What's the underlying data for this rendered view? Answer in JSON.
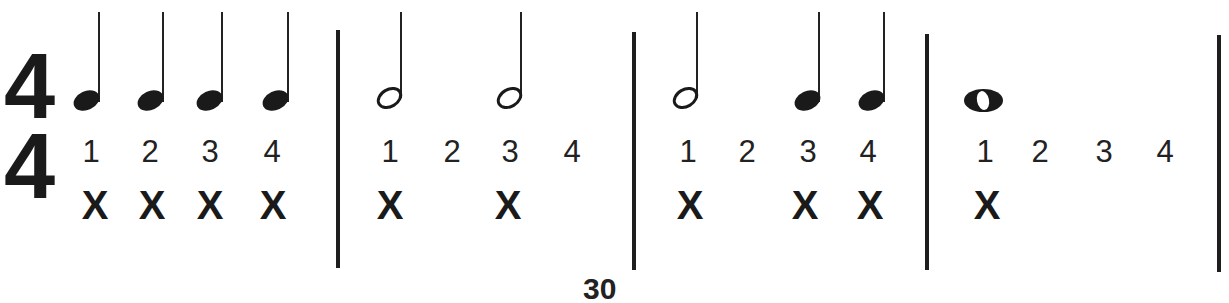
{
  "page": {
    "type": "rhythm-counting-exercise",
    "time_signature": {
      "top": "4",
      "bottom": "4"
    },
    "bottom_clipped_text": "30"
  },
  "measures": [
    {
      "notes": [
        "quarter",
        "quarter",
        "quarter",
        "quarter"
      ],
      "counts": [
        "1",
        "2",
        "3",
        "4"
      ],
      "claps": [
        "X",
        "X",
        "X",
        "X"
      ]
    },
    {
      "notes": [
        "half",
        "half"
      ],
      "counts": [
        "1",
        "2",
        "3",
        "4"
      ],
      "claps": [
        "X",
        "X"
      ]
    },
    {
      "notes": [
        "half",
        "quarter",
        "quarter"
      ],
      "counts": [
        "1",
        "2",
        "3",
        "4"
      ],
      "claps": [
        "X",
        "X",
        "X"
      ]
    },
    {
      "notes": [
        "whole"
      ],
      "counts": [
        "1",
        "2",
        "3",
        "4"
      ],
      "claps": [
        "X"
      ]
    }
  ],
  "colors": {
    "ink": "#1a1a1a",
    "paper": "#ffffff"
  }
}
